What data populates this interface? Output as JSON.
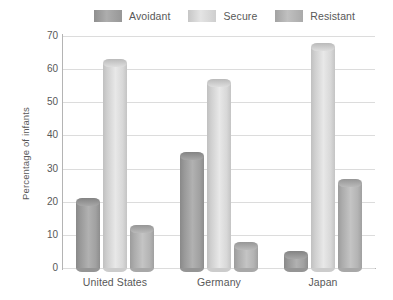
{
  "chart_data": {
    "type": "bar",
    "title": "",
    "xlabel": "",
    "ylabel": "Percentage of infants",
    "categories": [
      "United States",
      "Germany",
      "Japan"
    ],
    "series": [
      {
        "name": "Avoidant",
        "values": [
          21,
          35,
          5
        ],
        "color": "#9d9d9d"
      },
      {
        "name": "Secure",
        "values": [
          63,
          57,
          68
        ],
        "color": "#d4d4d4"
      },
      {
        "name": "Resistant",
        "values": [
          13,
          8,
          27
        ],
        "color": "#b0b0b0"
      }
    ],
    "ylim": [
      0,
      70
    ],
    "yticks": [
      0,
      10,
      20,
      30,
      40,
      50,
      60,
      70
    ],
    "ytick_labels": [
      "0",
      "10",
      "20",
      "30",
      "40",
      "50",
      "60",
      "70"
    ],
    "grid": true,
    "legend_position": "top",
    "axis_color": "#b4b4b4",
    "grid_color": "#dcdcdc",
    "text_color": "#585858",
    "background": "#ffffff"
  }
}
